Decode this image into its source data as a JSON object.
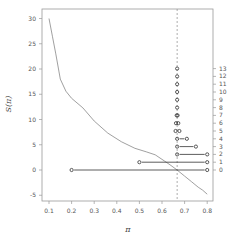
{
  "chart_data": {
    "type": "line",
    "title": "",
    "xlabel": "π",
    "ylabel": "S(π)",
    "xlim": [
      0.08,
      0.82
    ],
    "ylim": [
      -6,
      31.5
    ],
    "grid": false,
    "legend": null,
    "x_ticks": [
      0.1,
      0.2,
      0.3,
      0.4,
      0.5,
      0.6,
      0.7,
      0.8
    ],
    "x_tick_labels": [
      "0.1",
      "0.2",
      "0.3",
      "0.4",
      "0.5",
      "0.6",
      "0.7",
      "0.8"
    ],
    "y_ticks": [
      -5,
      0,
      5,
      10,
      15,
      20,
      25,
      30
    ],
    "y_tick_labels": [
      "-5",
      "0",
      "5",
      "10",
      "15",
      "20",
      "25",
      "30"
    ],
    "right_axis": {
      "ticks": [
        0,
        1,
        2,
        3,
        4,
        5,
        6,
        7,
        8,
        9,
        10,
        11,
        12,
        13
      ],
      "tick_labels": [
        "0",
        "1",
        "2",
        "3",
        "4",
        "5",
        "6",
        "7",
        "8",
        "9",
        "10",
        "11",
        "12",
        "13"
      ]
    },
    "curve": {
      "name": "S(π)",
      "color": "#888888",
      "x": [
        0.1,
        0.115,
        0.13,
        0.15,
        0.175,
        0.2,
        0.25,
        0.3,
        0.36,
        0.42,
        0.48,
        0.53,
        0.57,
        0.61,
        0.64,
        0.667,
        0.7,
        0.73,
        0.76,
        0.78,
        0.8
      ],
      "y": [
        30.0,
        26.5,
        23.0,
        18.0,
        15.6,
        14.2,
        12.3,
        9.7,
        7.3,
        5.6,
        4.3,
        3.6,
        3.0,
        1.8,
        0.9,
        0.0,
        -1.2,
        -2.3,
        -3.4,
        -4.0,
        -4.8
      ]
    },
    "vline": {
      "x": 0.667,
      "style": "dashed",
      "color": "#888888"
    },
    "intervals": [
      {
        "level": 0,
        "from": 0.2,
        "to": 0.8
      },
      {
        "level": 1,
        "from": 0.5,
        "to": 0.8
      },
      {
        "level": 2,
        "from": 0.667,
        "to": 0.8
      },
      {
        "level": 3,
        "from": 0.667,
        "to": 0.75
      },
      {
        "level": 4,
        "from": 0.667,
        "to": 0.71
      },
      {
        "level": 5,
        "from": 0.66,
        "to": 0.677
      },
      {
        "level": 6,
        "from": 0.662,
        "to": 0.672
      },
      {
        "level": 7,
        "from": 0.665,
        "to": 0.669
      },
      {
        "level": 8,
        "from": 0.667,
        "to": 0.667
      },
      {
        "level": 9,
        "from": 0.667,
        "to": 0.667
      },
      {
        "level": 10,
        "from": 0.667,
        "to": 0.667
      },
      {
        "level": 11,
        "from": 0.667,
        "to": 0.667
      },
      {
        "level": 12,
        "from": 0.667,
        "to": 0.667
      },
      {
        "level": 13,
        "from": 0.667,
        "to": 0.667
      }
    ],
    "colors": {
      "frame": "#999999",
      "interval": "#333333",
      "text": "#555555"
    }
  }
}
